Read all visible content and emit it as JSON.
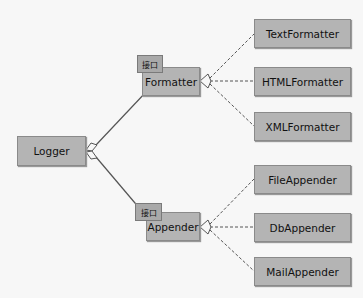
{
  "diagram": {
    "root": {
      "label": "Logger"
    },
    "interface_tag": "接口",
    "interfaces": [
      {
        "label": "Formatter",
        "tag": "接口"
      },
      {
        "label": "Appender",
        "tag": "接口"
      }
    ],
    "formatters": [
      {
        "label": "TextFormatter"
      },
      {
        "label": "HTMLFormatter"
      },
      {
        "label": "XMLFormatter"
      }
    ],
    "appenders": [
      {
        "label": "FileAppender"
      },
      {
        "label": "DbAppender"
      },
      {
        "label": "MailAppender"
      }
    ],
    "colors": {
      "box": "#b4b4b4",
      "border": "#8a8a8a",
      "line": "#555555",
      "background": "#f7f7f7"
    }
  }
}
